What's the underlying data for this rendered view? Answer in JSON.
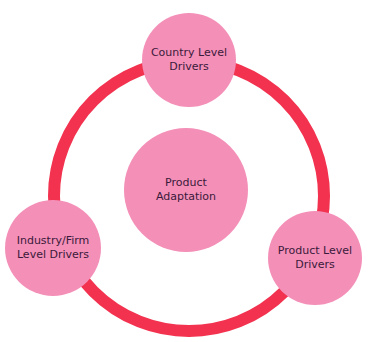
{
  "diagram": {
    "type": "cycle",
    "colors": {
      "ring": "#f2324f",
      "node_fill": "#f48fb8",
      "text": "#3a1a3a"
    },
    "center": {
      "label": "Product\nAdaptation"
    },
    "nodes": [
      {
        "label": "Country Level\nDrivers",
        "position": "top"
      },
      {
        "label": "Industry/Firm\nLevel Drivers",
        "position": "bottom-left"
      },
      {
        "label": "Product Level\nDrivers",
        "position": "bottom-right"
      }
    ]
  }
}
